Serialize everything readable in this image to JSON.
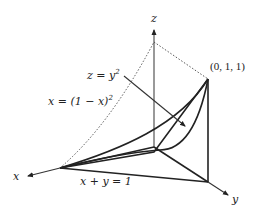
{
  "figure": {
    "type": "3d-region-diagram",
    "axes": {
      "x_label": "x",
      "y_label": "y",
      "z_label": "z"
    },
    "labels": {
      "curve_z": "z = y",
      "curve_z_exp": "2",
      "curve_x": "x = (1 − x)",
      "curve_x_exp": "2",
      "plane_line": "x + y = 1",
      "point": "(0, 1, 1)"
    },
    "colors": {
      "ink": "#222222",
      "axis": "#555555",
      "background": "#ffffff"
    }
  }
}
